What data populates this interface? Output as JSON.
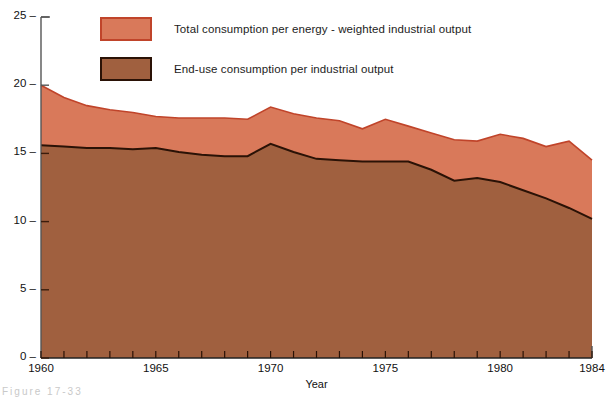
{
  "figure": {
    "caption_partial": "Figure  17-33"
  },
  "chart_data": {
    "type": "area",
    "stacked": true,
    "title": "",
    "subtitle": "",
    "xlabel": "Year",
    "ylabel": "",
    "xlim": [
      1960,
      1984
    ],
    "ylim": [
      0,
      25
    ],
    "ytick_values": [
      0,
      5,
      10,
      15,
      20,
      25
    ],
    "ytick_labels": [
      "0",
      "5",
      "10",
      "15",
      "20",
      "25"
    ],
    "xtick_values": [
      1960,
      1965,
      1970,
      1975,
      1980,
      1984
    ],
    "xtick_labels": [
      "1960",
      "1965",
      "1970",
      "1975",
      "1980",
      "1984"
    ],
    "minor_xticks_every": 1,
    "grid": false,
    "legend_position": "top-left-inside",
    "x": [
      1960,
      1961,
      1962,
      1963,
      1964,
      1965,
      1966,
      1967,
      1968,
      1969,
      1970,
      1971,
      1972,
      1973,
      1974,
      1975,
      1976,
      1977,
      1978,
      1979,
      1980,
      1981,
      1982,
      1983,
      1984
    ],
    "series": [
      {
        "name": "Total consumption per energy - weighted industrial output",
        "color": "#d9795a",
        "line_color": "#c0442a",
        "values": [
          20.0,
          19.1,
          18.5,
          18.2,
          18.0,
          17.7,
          17.6,
          17.6,
          17.6,
          17.5,
          18.4,
          17.9,
          17.6,
          17.4,
          16.8,
          17.5,
          17.0,
          16.5,
          16.0,
          15.9,
          16.4,
          16.1,
          15.5,
          15.9,
          14.5
        ]
      },
      {
        "name": "End-use consumption per industrial output",
        "color": "#a0603f",
        "line_color": "#2a1206",
        "values": [
          15.6,
          15.5,
          15.4,
          15.4,
          15.3,
          15.4,
          15.1,
          14.9,
          14.8,
          14.8,
          15.7,
          15.1,
          14.6,
          14.5,
          14.4,
          14.4,
          14.4,
          13.8,
          13.0,
          13.2,
          12.9,
          12.3,
          11.7,
          11.0,
          10.2
        ]
      }
    ]
  },
  "legend": {
    "items": [
      {
        "label": "Total consumption per energy - weighted industrial output"
      },
      {
        "label": "End-use consumption per industrial output"
      }
    ]
  }
}
